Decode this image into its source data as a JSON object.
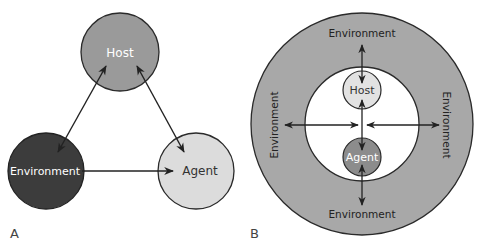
{
  "panel_a": {
    "label": "A",
    "nodes": {
      "host": {
        "label": "Host",
        "fill": "#9a9a9a",
        "text_color": "#ffffff"
      },
      "environment": {
        "label": "Environment",
        "fill": "#3c3c3c",
        "text_color": "#ffffff"
      },
      "agent": {
        "label": "Agent",
        "fill": "#dcdcdc",
        "text_color": "#333333"
      }
    },
    "edges": [
      {
        "from": "host",
        "to": "environment",
        "direction": "bidirectional"
      },
      {
        "from": "host",
        "to": "agent",
        "direction": "bidirectional"
      },
      {
        "from": "environment",
        "to": "agent",
        "direction": "one-way"
      }
    ]
  },
  "panel_b": {
    "label": "B",
    "outer_ring": {
      "fill": "#a8a8a8"
    },
    "inner_circle": {
      "fill": "#ffffff"
    },
    "ring_labels": {
      "top": "Environment",
      "bottom": "Environment",
      "left": "Environment",
      "right": "Environment"
    },
    "nodes": {
      "host": {
        "label": "Host",
        "fill": "#e2e2e2",
        "text_color": "#333333"
      },
      "agent": {
        "label": "Agent",
        "fill": "#8c8c8c",
        "text_color": "#ffffff"
      }
    }
  }
}
